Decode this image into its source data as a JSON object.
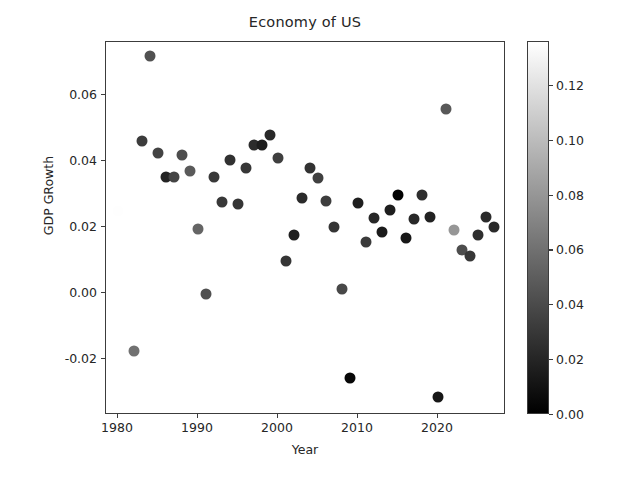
{
  "chart_data": {
    "type": "scatter",
    "title": "Economy of US",
    "xlabel": "Year",
    "ylabel": "GDP GRowth",
    "grid": false,
    "xlim": [
      1978.5,
      2028.5
    ],
    "ylim": [
      -0.037,
      0.076
    ],
    "xticks": [
      1980,
      1990,
      2000,
      2010,
      2020
    ],
    "xtick_labels": [
      "1980",
      "1990",
      "2000",
      "2010",
      "2020"
    ],
    "yticks": [
      0.06,
      0.04,
      0.02,
      0.0,
      -0.02
    ],
    "ytick_labels": [
      "0.06",
      "0.04",
      "0.02",
      "0.00",
      "-0.02"
    ],
    "colormap": "gray",
    "colorbar": {
      "label": "",
      "vmin": 0.0,
      "vmax": 0.136,
      "ticks": [
        0.12,
        0.1,
        0.08,
        0.06,
        0.04,
        0.02,
        0.0
      ],
      "tick_labels": [
        "0.12",
        "0.10",
        "0.08",
        "0.06",
        "0.04",
        "0.02",
        "0.00"
      ],
      "orientation": "vertical",
      "position": "right"
    },
    "color_variable": "Inflation",
    "marker": "circle",
    "marker_size": 11,
    "points": [
      {
        "year": 1980,
        "gdp_growth": 0.0248,
        "color_value": 0.1355
      },
      {
        "year": 1982,
        "gdp_growth": -0.0177,
        "color_value": 0.0603
      },
      {
        "year": 1983,
        "gdp_growth": 0.0459,
        "color_value": 0.0322
      },
      {
        "year": 1984,
        "gdp_growth": 0.0718,
        "color_value": 0.043
      },
      {
        "year": 1985,
        "gdp_growth": 0.0423,
        "color_value": 0.0355
      },
      {
        "year": 1986,
        "gdp_growth": 0.0351,
        "color_value": 0.019
      },
      {
        "year": 1987,
        "gdp_growth": 0.035,
        "color_value": 0.0365
      },
      {
        "year": 1988,
        "gdp_growth": 0.0418,
        "color_value": 0.0408
      },
      {
        "year": 1989,
        "gdp_growth": 0.0368,
        "color_value": 0.0482
      },
      {
        "year": 1990,
        "gdp_growth": 0.0195,
        "color_value": 0.0539
      },
      {
        "year": 1991,
        "gdp_growth": -0.0002,
        "color_value": 0.0425
      },
      {
        "year": 1992,
        "gdp_growth": 0.0352,
        "color_value": 0.0303
      },
      {
        "year": 1993,
        "gdp_growth": 0.0275,
        "color_value": 0.0296
      },
      {
        "year": 1994,
        "gdp_growth": 0.0403,
        "color_value": 0.0261
      },
      {
        "year": 1995,
        "gdp_growth": 0.0268,
        "color_value": 0.0281
      },
      {
        "year": 1996,
        "gdp_growth": 0.0377,
        "color_value": 0.0293
      },
      {
        "year": 1997,
        "gdp_growth": 0.0449,
        "color_value": 0.0234
      },
      {
        "year": 1998,
        "gdp_growth": 0.0448,
        "color_value": 0.0155
      },
      {
        "year": 1999,
        "gdp_growth": 0.0479,
        "color_value": 0.0219
      },
      {
        "year": 2000,
        "gdp_growth": 0.0408,
        "color_value": 0.0338
      },
      {
        "year": 2001,
        "gdp_growth": 0.0098,
        "color_value": 0.0283
      },
      {
        "year": 2002,
        "gdp_growth": 0.0174,
        "color_value": 0.0159
      },
      {
        "year": 2003,
        "gdp_growth": 0.0286,
        "color_value": 0.0227
      },
      {
        "year": 2004,
        "gdp_growth": 0.0379,
        "color_value": 0.0268
      },
      {
        "year": 2005,
        "gdp_growth": 0.0348,
        "color_value": 0.0339
      },
      {
        "year": 2006,
        "gdp_growth": 0.0279,
        "color_value": 0.0323
      },
      {
        "year": 2007,
        "gdp_growth": 0.0201,
        "color_value": 0.0285
      },
      {
        "year": 2008,
        "gdp_growth": 0.0012,
        "color_value": 0.0384
      },
      {
        "year": 2009,
        "gdp_growth": -0.0258,
        "color_value": 0.0036
      },
      {
        "year": 2010,
        "gdp_growth": 0.0271,
        "color_value": 0.0164
      },
      {
        "year": 2011,
        "gdp_growth": 0.0155,
        "color_value": 0.0316
      },
      {
        "year": 2012,
        "gdp_growth": 0.0228,
        "color_value": 0.0207
      },
      {
        "year": 2013,
        "gdp_growth": 0.0184,
        "color_value": 0.0146
      },
      {
        "year": 2014,
        "gdp_growth": 0.0252,
        "color_value": 0.0162
      },
      {
        "year": 2015,
        "gdp_growth": 0.0295,
        "color_value": 0.0012
      },
      {
        "year": 2016,
        "gdp_growth": 0.0167,
        "color_value": 0.0126
      },
      {
        "year": 2017,
        "gdp_growth": 0.0224,
        "color_value": 0.0213
      },
      {
        "year": 2018,
        "gdp_growth": 0.0295,
        "color_value": 0.0244
      },
      {
        "year": 2019,
        "gdp_growth": 0.0229,
        "color_value": 0.0181
      },
      {
        "year": 2020,
        "gdp_growth": -0.0316,
        "color_value": 0.0123
      },
      {
        "year": 2021,
        "gdp_growth": 0.0557,
        "color_value": 0.047
      },
      {
        "year": 2022,
        "gdp_growth": 0.0189,
        "color_value": 0.08
      },
      {
        "year": 2023,
        "gdp_growth": 0.0129,
        "color_value": 0.0413
      },
      {
        "year": 2024,
        "gdp_growth": 0.0111,
        "color_value": 0.0295
      },
      {
        "year": 2025,
        "gdp_growth": 0.0175,
        "color_value": 0.0244
      },
      {
        "year": 2026,
        "gdp_growth": 0.0231,
        "color_value": 0.0232
      },
      {
        "year": 2027,
        "gdp_growth": 0.0199,
        "color_value": 0.0226
      }
    ]
  }
}
